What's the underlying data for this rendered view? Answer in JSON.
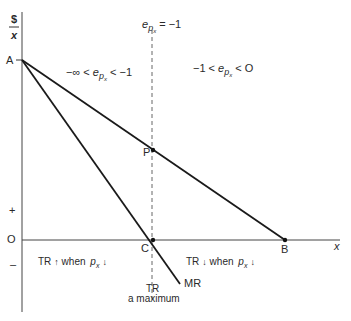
{
  "axes": {
    "y_label_top": "$",
    "y_label_bottom": "x",
    "x_label": "x",
    "plus_label": "+",
    "zero_label": "O",
    "minus_label": "–"
  },
  "points": {
    "A": "A",
    "P": "P",
    "C": "C",
    "B": "B"
  },
  "curves": {
    "mr_label": "MR"
  },
  "annotations": {
    "unit_elastic": {
      "e": "e",
      "sub": "p",
      "subsub": "x",
      "rest": " = −1"
    },
    "elastic_region": {
      "pre": "−∞ < ",
      "e": "e",
      "sub": "p",
      "subsub": "x",
      "post": " < −1"
    },
    "inelastic_region": {
      "pre": "−1 < ",
      "e": "e",
      "sub": "p",
      "subsub": "x",
      "post": " < O"
    },
    "left_tr": {
      "tr": "TR",
      "arrow1": "↑",
      "when": " when ",
      "p": "p",
      "sub": "x",
      "arrow2": "↓"
    },
    "right_tr": {
      "tr": "TR",
      "arrow1": "↓",
      "when": " when ",
      "p": "p",
      "sub": "x",
      "arrow2": "↓"
    },
    "tr_max_line1": "TR",
    "tr_max_line2": "a maximum"
  },
  "colors": {
    "line": "#1a1a1a",
    "axis": "#333333",
    "dashed": "#555555"
  }
}
